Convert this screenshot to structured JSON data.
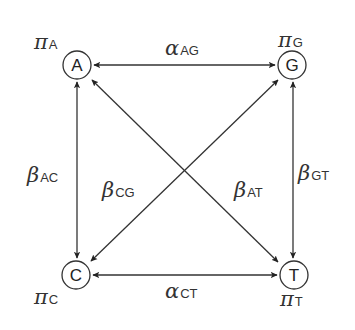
{
  "diagram": {
    "nodes": [
      {
        "id": "A",
        "label": "A",
        "x": 77,
        "y": 65,
        "freq_symbol": "π",
        "freq_sub": "A",
        "freq_x": 32,
        "freq_y": 49
      },
      {
        "id": "G",
        "label": "G",
        "x": 292,
        "y": 65,
        "freq_symbol": "π",
        "freq_sub": "G",
        "freq_x": 278,
        "freq_y": 47
      },
      {
        "id": "C",
        "label": "C",
        "x": 76,
        "y": 275,
        "freq_symbol": "π",
        "freq_sub": "C",
        "freq_x": 34,
        "freq_y": 304
      },
      {
        "id": "T",
        "label": "T",
        "x": 294,
        "y": 275,
        "freq_symbol": "π",
        "freq_sub": "T",
        "freq_x": 280,
        "freq_y": 306
      }
    ],
    "edges": [
      {
        "from": "A",
        "to": "G",
        "type": "transition",
        "symbol": "α",
        "sub": "AG",
        "label_x": 165,
        "label_y": 55
      },
      {
        "from": "C",
        "to": "T",
        "type": "transition",
        "symbol": "α",
        "sub": "CT",
        "label_x": 165,
        "label_y": 298
      },
      {
        "from": "A",
        "to": "C",
        "type": "transversion",
        "symbol": "β",
        "sub": "AC",
        "label_x": 28,
        "label_y": 182
      },
      {
        "from": "G",
        "to": "T",
        "type": "transversion",
        "symbol": "β",
        "sub": "GT",
        "label_x": 299,
        "label_y": 179
      },
      {
        "from": "C",
        "to": "G",
        "type": "transversion",
        "symbol": "β",
        "sub": "CG",
        "label_x": 102,
        "label_y": 196
      },
      {
        "from": "A",
        "to": "T",
        "type": "transversion",
        "symbol": "β",
        "sub": "AT",
        "label_x": 235,
        "label_y": 196
      }
    ]
  }
}
